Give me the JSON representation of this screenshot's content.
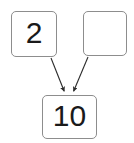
{
  "diagram": {
    "type": "number-bond",
    "background_color": "#ffffff",
    "box_border_color": "#8d8d8d",
    "text_color": "#1a1a1a",
    "arrow_color": "#2b2b2b",
    "nodes": [
      {
        "id": "addend-left",
        "role": "part",
        "value": "2",
        "empty": false,
        "x": 11,
        "y": 11,
        "width": 46,
        "height": 46
      },
      {
        "id": "addend-right",
        "role": "part",
        "value": "",
        "empty": true,
        "x": 83,
        "y": 11,
        "width": 44,
        "height": 45
      },
      {
        "id": "sum",
        "role": "whole",
        "value": "10",
        "empty": false,
        "x": 42,
        "y": 95,
        "width": 55,
        "height": 44
      }
    ],
    "arrows": [
      {
        "id": "arrow-left-to-sum",
        "from": "addend-left",
        "to": "sum",
        "start_x": 51,
        "start_y": 58,
        "end_x": 65,
        "end_y": 93
      },
      {
        "id": "arrow-right-to-sum",
        "from": "addend-right",
        "to": "sum",
        "start_x": 88,
        "start_y": 57,
        "end_x": 73,
        "end_y": 93
      }
    ]
  }
}
